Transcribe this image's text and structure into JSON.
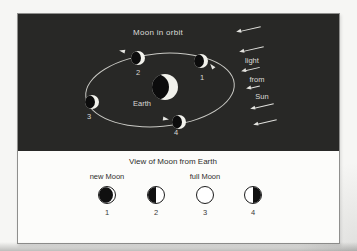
{
  "orbit_panel": {
    "title": "Moon in orbit",
    "earth_label": "Earth",
    "moons": [
      {
        "number": "1"
      },
      {
        "number": "2"
      },
      {
        "number": "3"
      },
      {
        "number": "4"
      }
    ],
    "sun_words": [
      "light",
      "from",
      "Sun"
    ]
  },
  "view_panel": {
    "title": "View of Moon from Earth",
    "phases": [
      {
        "number": "1",
        "label": "new Moon",
        "phase": "new"
      },
      {
        "number": "2",
        "label": "",
        "phase": "first-quarter"
      },
      {
        "number": "3",
        "label": "full Moon",
        "phase": "full"
      },
      {
        "number": "4",
        "label": "",
        "phase": "last-quarter"
      }
    ]
  },
  "colors": {
    "panel_background": "#282826",
    "photo_background": "#f6f6f4",
    "sphere_lit": "#f2f2ec",
    "sphere_dark": "#0c0c0c",
    "orbit_line": "#c9c9c4",
    "light_text": "#dcdcd8",
    "dark_text": "#2e2e2c",
    "card_border": "#8f8f8d"
  }
}
